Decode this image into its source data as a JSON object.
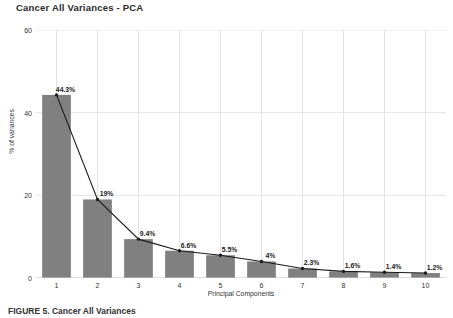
{
  "chart_data": {
    "type": "bar",
    "title": "Cancer All Variances - PCA",
    "xlabel": "Principal Components",
    "ylabel": "% of variances",
    "categories": [
      "1",
      "2",
      "3",
      "4",
      "5",
      "6",
      "7",
      "8",
      "9",
      "10"
    ],
    "values": [
      44.3,
      19.0,
      9.4,
      6.6,
      5.5,
      4.0,
      2.3,
      1.6,
      1.4,
      1.2
    ],
    "data_labels": [
      "44.3%",
      "19%",
      "9.4%",
      "6.6%",
      "5.5%",
      "4%",
      "2.3%",
      "1.6%",
      "1.4%",
      "1.2%"
    ],
    "ylim": [
      0,
      60
    ],
    "yticks": [
      0,
      20,
      40,
      60
    ],
    "ytick_labels": [
      "0",
      "20",
      "40",
      "60"
    ],
    "grid": "both",
    "legend": "none",
    "series": [
      {
        "name": "% of variances",
        "type": "bar",
        "color": "#808080",
        "values": [
          44.3,
          19.0,
          9.4,
          6.6,
          5.5,
          4.0,
          2.3,
          1.6,
          1.4,
          1.2
        ]
      },
      {
        "name": "trend-line",
        "type": "line",
        "color": "#000000",
        "values": [
          44.3,
          19.0,
          9.4,
          6.6,
          5.5,
          4.0,
          2.3,
          1.6,
          1.4,
          1.2
        ]
      }
    ]
  },
  "colors": {
    "bar_fill": "#808080",
    "line": "#1a1a1a",
    "grid": "#e4e4e4",
    "axis_text": "#333333",
    "title_text": "#2b2b2b",
    "background": "#ffffff"
  },
  "caption": {
    "text": "FIGURE 5. Cancer All Variances"
  }
}
